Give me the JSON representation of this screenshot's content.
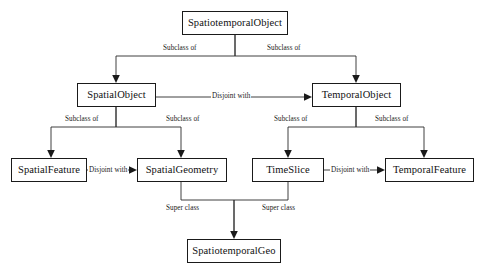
{
  "diagram": {
    "background_color": "#ffffff",
    "line_color": "#2b2b2b",
    "text_color": "#111111",
    "nodes": [
      {
        "id": "spatiotemporal-object",
        "label": "SpatiotemporalObject",
        "x": 182,
        "y": 11,
        "w": 106,
        "h": 24
      },
      {
        "id": "spatial-object",
        "label": "SpatialObject",
        "x": 77,
        "y": 83,
        "w": 79,
        "h": 24
      },
      {
        "id": "temporal-object",
        "label": "TemporalObject",
        "x": 312,
        "y": 83,
        "w": 89,
        "h": 24
      },
      {
        "id": "spatial-feature",
        "label": "SpatialFeature",
        "x": 11,
        "y": 158,
        "w": 76,
        "h": 24
      },
      {
        "id": "spatial-geometry",
        "label": "SpatialGeometry",
        "x": 137,
        "y": 158,
        "w": 90,
        "h": 24
      },
      {
        "id": "time-slice",
        "label": "TimeSlice",
        "x": 252,
        "y": 158,
        "w": 72,
        "h": 24
      },
      {
        "id": "temporal-feature",
        "label": "TemporalFeature",
        "x": 385,
        "y": 158,
        "w": 89,
        "h": 24
      },
      {
        "id": "spatiotemporal-geo",
        "label": "SpatiotemporalGeo",
        "x": 187,
        "y": 239,
        "w": 94,
        "h": 24
      }
    ],
    "edges": [
      {
        "id": "e1",
        "from": "spatiotemporal-object",
        "to": "spatial-object",
        "label": "Subclass of",
        "label_x": 163,
        "label_y": 45
      },
      {
        "id": "e2",
        "from": "spatiotemporal-object",
        "to": "temporal-object",
        "label": "Subclass of",
        "label_x": 267,
        "label_y": 45
      },
      {
        "id": "e3",
        "from": "spatial-object",
        "to": "temporal-object",
        "label": "Disjoint with",
        "label_x": 211,
        "label_y": 96
      },
      {
        "id": "e4",
        "from": "spatial-object",
        "to": "spatial-feature",
        "label": "Subclass of",
        "label_x": 65,
        "label_y": 119
      },
      {
        "id": "e5",
        "from": "spatial-object",
        "to": "spatial-geometry",
        "label": "Subclass of",
        "label_x": 166,
        "label_y": 119
      },
      {
        "id": "e6",
        "from": "temporal-object",
        "to": "time-slice",
        "label": "Subclass of",
        "label_x": 274,
        "label_y": 119
      },
      {
        "id": "e7",
        "from": "temporal-object",
        "to": "temporal-feature",
        "label": "Subclass of",
        "label_x": 375,
        "label_y": 119
      },
      {
        "id": "e8",
        "from": "spatial-feature",
        "to": "spatial-geometry",
        "label": "Disjoint with",
        "label_x": 88,
        "label_y": 172
      },
      {
        "id": "e9",
        "from": "time-slice",
        "to": "temporal-feature",
        "label": "Disjoint with",
        "label_x": 332,
        "label_y": 172
      },
      {
        "id": "e10",
        "from": "spatial-geometry",
        "to": "spatiotemporal-geo",
        "label": "Super class",
        "label_x": 166,
        "label_y": 208
      },
      {
        "id": "e11",
        "from": "time-slice",
        "to": "spatiotemporal-geo",
        "label": "Super class",
        "label_x": 264,
        "label_y": 208
      }
    ]
  }
}
